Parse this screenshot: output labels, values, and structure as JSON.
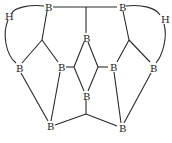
{
  "diagram": {
    "atoms": [
      {
        "id": "b_top_left",
        "label": "B",
        "x": 48,
        "y": 7
      },
      {
        "id": "b_top_right",
        "label": "B",
        "x": 122,
        "y": 7
      },
      {
        "id": "h_left",
        "label": "H",
        "x": 8,
        "y": 16
      },
      {
        "id": "h_right",
        "label": "H",
        "x": 164,
        "y": 19
      },
      {
        "id": "b_left",
        "label": "B",
        "x": 19,
        "y": 68
      },
      {
        "id": "b_center_left",
        "label": "B",
        "x": 61,
        "y": 67
      },
      {
        "id": "b_center_top",
        "label": "B",
        "x": 86,
        "y": 38
      },
      {
        "id": "b_center_right",
        "label": "B",
        "x": 113,
        "y": 67
      },
      {
        "id": "b_right",
        "label": "B",
        "x": 153,
        "y": 68
      },
      {
        "id": "b_center_bottom",
        "label": "B",
        "x": 86,
        "y": 96
      },
      {
        "id": "b_bottom_left",
        "label": "B",
        "x": 50,
        "y": 126
      },
      {
        "id": "b_bottom_right",
        "label": "B",
        "x": 122,
        "y": 128
      }
    ],
    "stroke_color": "#2a2a2a",
    "text_color": "#222222"
  }
}
